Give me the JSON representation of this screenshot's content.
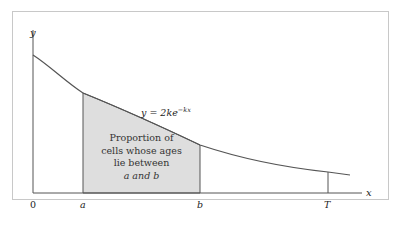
{
  "diagram": {
    "axes": {
      "y_label": "y",
      "x_label": "x",
      "origin_label": "0"
    },
    "curve": {
      "equation_prefix": "y = 2ke",
      "equation_exponent": "−kx",
      "color": "#555555"
    },
    "markers": [
      {
        "label": "a"
      },
      {
        "label": "b"
      },
      {
        "label": "T"
      }
    ],
    "shaded_region": {
      "fill": "#dedede",
      "lines": [
        "Proportion of",
        "cells whose ages",
        "lie between",
        "a and b"
      ]
    }
  }
}
